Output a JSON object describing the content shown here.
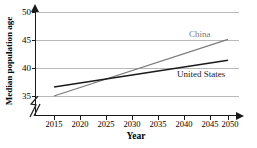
{
  "chart_data": {
    "type": "line",
    "title": "",
    "xlabel": "Year",
    "ylabel": "Median population age",
    "xlim": [
      2013,
      2052
    ],
    "ylim": [
      34,
      51
    ],
    "grid": true,
    "legend_position": "inline-right",
    "x_ticks": [
      2015,
      2020,
      2025,
      2030,
      2035,
      2040,
      2045,
      2050
    ],
    "y_ticks": [
      35,
      40,
      45,
      50
    ],
    "y_axis_break": true,
    "y_axis_break_symbol": "zigzag",
    "x": [
      2015,
      2050
    ],
    "series": [
      {
        "name": "China",
        "color": "#7b7b7b",
        "values": [
          35.0,
          45.1
        ]
      },
      {
        "name": "United States",
        "color": "#1a1a1a",
        "values": [
          36.6,
          41.4
        ]
      }
    ],
    "annotations": [
      {
        "text": "China",
        "color": "#7b7b7b"
      },
      {
        "text": "United States",
        "color": "#1a1a1a"
      }
    ]
  },
  "axes": {
    "y_title": "Median population age",
    "x_title": "Year",
    "y_tick_labels": [
      "50",
      "45",
      "40",
      "35"
    ],
    "x_tick_labels": [
      "2015",
      "2020",
      "2025",
      "2030",
      "2035",
      "2040",
      "2045",
      "2050"
    ]
  },
  "labels": {
    "china": "China",
    "united_states": "United States"
  },
  "colors": {
    "china_line": "#7b7b7b",
    "us_line": "#1a1a1a",
    "gridline": "#b9b9b9",
    "axis": "#1a1a1a",
    "background": "#ffffff"
  }
}
